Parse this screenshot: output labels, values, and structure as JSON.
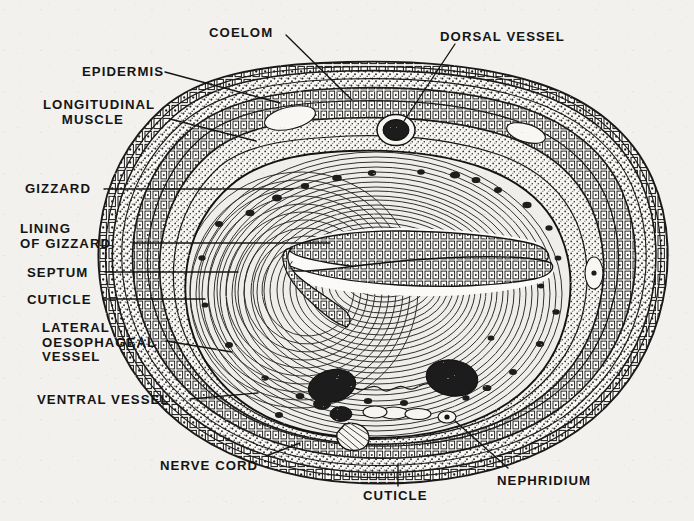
{
  "figure": {
    "kind": "labeled-anatomical-cross-section",
    "background_color": "#f2f1ee",
    "ink_color": "#151515"
  },
  "labels": [
    {
      "id": "coelom",
      "text": "COELOM",
      "x": 209,
      "y": 26,
      "align": "left"
    },
    {
      "id": "dorsal-vessel",
      "text": "DORSAL VESSEL",
      "x": 440,
      "y": 30,
      "align": "left"
    },
    {
      "id": "epidermis",
      "text": "EPIDERMIS",
      "x": 82,
      "y": 65,
      "align": "left"
    },
    {
      "id": "longitudinal-muscle",
      "text": "LONGITUDINAL\n    MUSCLE",
      "x": 43,
      "y": 98,
      "align": "left"
    },
    {
      "id": "gizzard",
      "text": "GIZZARD",
      "x": 25,
      "y": 182,
      "align": "left"
    },
    {
      "id": "lining-of-gizzard",
      "text": "LINING\nOF GIZZARD",
      "x": 20,
      "y": 222,
      "align": "left"
    },
    {
      "id": "septum",
      "text": "SEPTUM",
      "x": 27,
      "y": 266,
      "align": "left"
    },
    {
      "id": "cuticle-left",
      "text": "CUTICLE",
      "x": 27,
      "y": 293,
      "align": "left"
    },
    {
      "id": "lateral-oesophageal-vessel",
      "text": "LATERAL\nOESOPHAGEAL\nVESSEL",
      "x": 42,
      "y": 321,
      "align": "left"
    },
    {
      "id": "ventral-vessel",
      "text": "VENTRAL VESSEL",
      "x": 37,
      "y": 393,
      "align": "left"
    },
    {
      "id": "nerve-cord",
      "text": "NERVE CORD",
      "x": 160,
      "y": 459,
      "align": "left"
    },
    {
      "id": "cuticle-bottom",
      "text": "CUTICLE",
      "x": 363,
      "y": 489,
      "align": "left"
    },
    {
      "id": "nephridium",
      "text": "NEPHRIDIUM",
      "x": 497,
      "y": 474,
      "align": "left"
    }
  ],
  "leaders": [
    {
      "id": "leader-coelom",
      "points": "286,35 352,100"
    },
    {
      "id": "leader-dorsal-vessel",
      "points": "455,44 404,121"
    },
    {
      "id": "leader-epidermis",
      "points": "165,72 280,103"
    },
    {
      "id": "leader-longitudinal-muscle",
      "points": "170,119 256,141"
    },
    {
      "id": "leader-gizzard",
      "points": "104,189 293,189"
    },
    {
      "id": "leader-lining-of-gizzard",
      "points": "133,243 330,243"
    },
    {
      "id": "leader-septum",
      "points": "105,272 238,272"
    },
    {
      "id": "leader-cuticle-left",
      "points": "103,299 205,299"
    },
    {
      "id": "leader-lateral-oesophageal-vessel",
      "points": "166,341 232,352"
    },
    {
      "id": "leader-ventral-vessel",
      "points": "190,399 258,393"
    },
    {
      "id": "leader-nerve-cord",
      "points": "266,456 300,443"
    },
    {
      "id": "leader-cuticle-bottom",
      "points": "398,486 398,464"
    },
    {
      "id": "leader-nephridium",
      "points": "508,468 455,421"
    }
  ],
  "anatomy": {
    "layers": [
      {
        "id": "cuticle",
        "label": "CUTICLE"
      },
      {
        "id": "epidermis",
        "label": "EPIDERMIS"
      },
      {
        "id": "circular-muscle",
        "label": "CIRCULAR MUSCLE"
      },
      {
        "id": "longitudinal-muscle",
        "label": "LONGITUDINAL MUSCLE"
      },
      {
        "id": "coelom",
        "label": "COELOM"
      },
      {
        "id": "septum",
        "label": "SEPTUM"
      },
      {
        "id": "gizzard-muscle",
        "label": "GIZZARD"
      },
      {
        "id": "gizzard-lining",
        "label": "LINING OF GIZZARD"
      }
    ],
    "vessels": [
      {
        "id": "dorsal-vessel",
        "label": "DORSAL VESSEL",
        "cx": 396,
        "cy": 130,
        "rx": 16,
        "ry": 13
      },
      {
        "id": "lateral-oesophageal-vessel-left",
        "label": "LATERAL OESOPHAGEAL VESSEL",
        "cx": 331,
        "cy": 385,
        "rx": 22,
        "ry": 16
      },
      {
        "id": "lateral-oesophageal-vessel-right",
        "label": "LATERAL OESOPHAGEAL VESSEL",
        "cx": 450,
        "cy": 377,
        "rx": 24,
        "ry": 17
      },
      {
        "id": "ventral-vessel",
        "label": "VENTRAL VESSEL",
        "cx": 343,
        "cy": 413,
        "rx": 11,
        "ry": 8
      }
    ],
    "nerve_cord": {
      "id": "nerve-cord",
      "label": "NERVE CORD",
      "cx": 355,
      "cy": 434,
      "rx": 13,
      "ry": 12
    },
    "nephridium": {
      "id": "nephridium",
      "label": "NEPHRIDIUM",
      "cx": 447,
      "cy": 416,
      "rx": 8,
      "ry": 6
    }
  }
}
